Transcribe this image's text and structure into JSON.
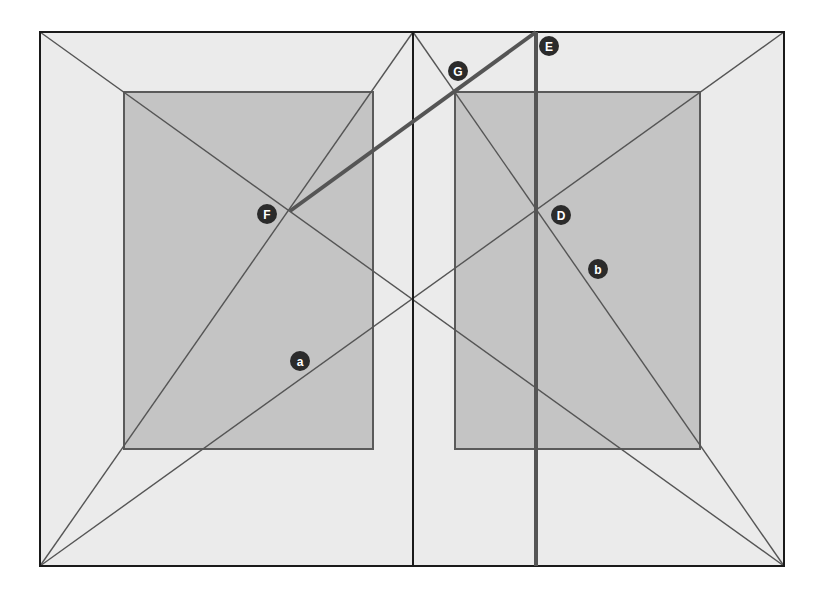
{
  "figure": {
    "width": 820,
    "height": 594,
    "colors": {
      "background": "#ffffff",
      "page_fill": "#ebebeb",
      "text_block_fill": "#c4c4c4",
      "frame_stroke": "#1a1a1a",
      "diagonal_stroke": "#555555",
      "block_stroke": "#5a5a5a",
      "construction_stroke": "#555555",
      "label_fill": "#2b2b2b",
      "label_text": "#ffffff"
    },
    "spread": {
      "x1": 40,
      "y1": 32,
      "x2": 784,
      "y2": 566,
      "spine_x": 413
    },
    "pages": [
      {
        "name": "left-page",
        "x": 40,
        "y": 32,
        "w": 373,
        "h": 534
      },
      {
        "name": "right-page",
        "x": 413,
        "y": 32,
        "w": 371,
        "h": 534
      }
    ],
    "text_blocks": [
      {
        "name": "left-text-block",
        "x": 124,
        "y": 92,
        "w": 249,
        "h": 357
      },
      {
        "name": "right-text-block",
        "x": 455,
        "y": 92,
        "w": 245,
        "h": 357
      }
    ],
    "diagonals": [
      {
        "name": "spread-diagonal-a",
        "x1": 40,
        "y1": 566,
        "x2": 784,
        "y2": 32
      },
      {
        "name": "spread-diagonal-b",
        "x1": 40,
        "y1": 32,
        "x2": 784,
        "y2": 566
      },
      {
        "name": "left-page-diagonal",
        "x1": 40,
        "y1": 566,
        "x2": 413,
        "y2": 32
      },
      {
        "name": "right-page-diagonal-b",
        "x1": 413,
        "y1": 32,
        "x2": 784,
        "y2": 566
      }
    ],
    "construction_lines": [
      {
        "name": "vertical-line-E-D",
        "x1": 536,
        "y1": 32,
        "x2": 536,
        "y2": 566,
        "width": 4
      },
      {
        "name": "line-F-G-E",
        "x1": 290,
        "y1": 211,
        "x2": 536,
        "y2": 32,
        "width": 4
      }
    ],
    "labels": [
      {
        "name": "label-E",
        "text": "E",
        "cx": 549,
        "cy": 46
      },
      {
        "name": "label-G",
        "text": "G",
        "cx": 458,
        "cy": 71
      },
      {
        "name": "label-F",
        "text": "F",
        "cx": 267,
        "cy": 214
      },
      {
        "name": "label-D",
        "text": "D",
        "cx": 561,
        "cy": 215
      },
      {
        "name": "label-b",
        "text": "b",
        "cx": 598,
        "cy": 269
      },
      {
        "name": "label-a",
        "text": "a",
        "cx": 300,
        "cy": 361
      }
    ]
  }
}
